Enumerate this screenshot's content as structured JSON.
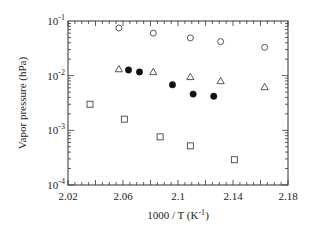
{
  "chart_data": {
    "type": "scatter",
    "title": "",
    "xlabel": "1000 / T (K⁻¹)",
    "xlabel_main": "1000 / T (K",
    "xlabel_sup": "-1",
    "xlabel_close": ")",
    "ylabel": "Vapor pressure (hPa)",
    "xlim": [
      2.02,
      2.18
    ],
    "ylim": [
      0.0001,
      0.1
    ],
    "yscale": "log",
    "grid": false,
    "legend": null,
    "x_ticks": [
      {
        "value": 2.02,
        "label": "2.02"
      },
      {
        "value": 2.06,
        "label": "2.06"
      },
      {
        "value": 2.1,
        "label": "2.1"
      },
      {
        "value": 2.14,
        "label": "2.14"
      },
      {
        "value": 2.18,
        "label": "2.18"
      }
    ],
    "y_ticks": [
      {
        "value": 0.1,
        "base": "10",
        "exp": "-1"
      },
      {
        "value": 0.01,
        "base": "10",
        "exp": "-2"
      },
      {
        "value": 0.001,
        "base": "10",
        "exp": "-3"
      },
      {
        "value": 0.0001,
        "base": "10",
        "exp": "-4"
      }
    ],
    "series": [
      {
        "name": "open circles",
        "marker": "circle-open",
        "x": [
          2.057,
          2.082,
          2.109,
          2.131,
          2.163
        ],
        "y": [
          0.0745,
          0.06,
          0.049,
          0.042,
          0.033
        ]
      },
      {
        "name": "open triangles",
        "marker": "triangle-open",
        "x": [
          2.057,
          2.082,
          2.109,
          2.131,
          2.163
        ],
        "y": [
          0.0132,
          0.0117,
          0.0095,
          0.008,
          0.0062
        ]
      },
      {
        "name": "filled circles",
        "marker": "circle-filled",
        "x": [
          2.064,
          2.072,
          2.096,
          2.111,
          2.126
        ],
        "y": [
          0.0127,
          0.0117,
          0.0068,
          0.0046,
          0.0042
        ]
      },
      {
        "name": "open squares",
        "marker": "square-open",
        "x": [
          2.036,
          2.061,
          2.087,
          2.109,
          2.141
        ],
        "y": [
          0.003,
          0.0016,
          0.00076,
          0.00052,
          0.00029
        ]
      }
    ]
  },
  "style": {
    "axis_color": "#333333",
    "marker_color": "#444444",
    "background": "#ffffff"
  }
}
